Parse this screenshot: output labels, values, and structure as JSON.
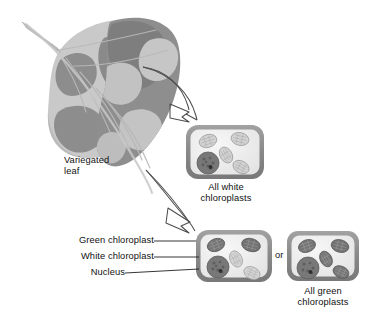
{
  "figure": {
    "type": "biology-diagram",
    "background_color": "#ffffff",
    "palette": {
      "green_chloroplast": "#6e6e6e",
      "white_chloroplast": "#d0d0d0",
      "nucleus": "#707070",
      "cell_wall": "#8c8c8c",
      "cytoplasm": "#efefef",
      "leaf_dark": "#8a8a8a",
      "leaf_light": "#c9c9c9",
      "arrow_stroke": "#4a4a4a",
      "text": "#111111"
    }
  },
  "leaf": {
    "label_line1": "Variegated",
    "label_line2": "leaf",
    "description": "Leaf with dark gray (green) and light gray (white) variegated patches, midrib and veins visible"
  },
  "arrows": [
    {
      "name": "arrow-to-white-cell",
      "style": "open-outline",
      "from": "leaf-white-patch",
      "to": "all-white-cell"
    },
    {
      "name": "arrow-to-mixed-cell",
      "style": "open-outline",
      "from": "leaf-green-patch",
      "to": "mixed-cell"
    }
  ],
  "cells": {
    "white_cell": {
      "name": "all-white-chloroplast-cell",
      "caption_line1": "All white",
      "caption_line2": "chloroplasts",
      "chloroplasts": [
        {
          "type": "white",
          "x": 22,
          "y": 16,
          "r": 9,
          "rot": -18
        },
        {
          "type": "white",
          "x": 54,
          "y": 14,
          "r": 9,
          "rot": 12
        },
        {
          "type": "white",
          "x": 40,
          "y": 30,
          "r": 8.5,
          "rot": 60
        },
        {
          "type": "white",
          "x": 55,
          "y": 42,
          "r": 8.5,
          "rot": 28
        }
      ],
      "nucleus": {
        "x": 22,
        "y": 38,
        "r": 11
      }
    },
    "mixed_cell": {
      "name": "mixed-chloroplast-cell",
      "chloroplasts": [
        {
          "type": "green",
          "x": 20,
          "y": 15,
          "r": 9,
          "rot": -20
        },
        {
          "type": "green",
          "x": 55,
          "y": 15,
          "r": 9.5,
          "rot": 15
        },
        {
          "type": "white",
          "x": 40,
          "y": 29,
          "r": 8.5,
          "rot": 65
        },
        {
          "type": "white",
          "x": 56,
          "y": 43,
          "r": 8.5,
          "rot": 25
        }
      ],
      "nucleus": {
        "x": 22,
        "y": 37,
        "r": 11
      }
    },
    "green_cell": {
      "name": "all-green-chloroplast-cell",
      "caption_line1": "All green",
      "caption_line2": "chloroplasts",
      "chloroplasts": [
        {
          "type": "green",
          "x": 20,
          "y": 15,
          "r": 9,
          "rot": -20
        },
        {
          "type": "green",
          "x": 55,
          "y": 15,
          "r": 9.5,
          "rot": 15
        },
        {
          "type": "green",
          "x": 40,
          "y": 28,
          "r": 8.5,
          "rot": 62
        },
        {
          "type": "green",
          "x": 56,
          "y": 42,
          "r": 8.5,
          "rot": 25
        }
      ],
      "nucleus": {
        "x": 21,
        "y": 37,
        "r": 11
      }
    }
  },
  "callouts": [
    {
      "name": "callout-green-chloroplast",
      "label": "Green chloroplast"
    },
    {
      "name": "callout-white-chloroplast",
      "label": "White chloroplast"
    },
    {
      "name": "callout-nucleus",
      "label": "Nucleus"
    }
  ],
  "connector": {
    "label": "or"
  }
}
